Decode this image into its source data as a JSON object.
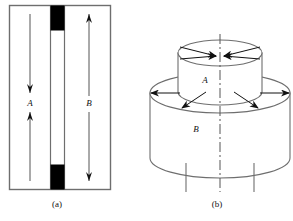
{
  "figure": {
    "type": "technical-line-diagram",
    "background": "#ffffff",
    "stroke_color": "#3f3f3f",
    "fill_black": "#000000",
    "panels": [
      {
        "id": "a",
        "caption": "(a)",
        "description": "rectangular cross-section view with inner vertical channel capped top and bottom by solid black blocks",
        "labels": [
          {
            "text": "A",
            "role": "inner-flow-label"
          },
          {
            "text": "B",
            "role": "outer-flow-label"
          }
        ],
        "arrows": [
          {
            "name": "A-down-arrow",
            "direction": "down"
          },
          {
            "name": "A-up-arrow",
            "direction": "up"
          },
          {
            "name": "B-up-arrow",
            "direction": "up"
          },
          {
            "name": "B-down-arrow",
            "direction": "down"
          }
        ],
        "blocks": [
          {
            "name": "top-plug",
            "color": "#000000"
          },
          {
            "name": "bottom-plug",
            "color": "#000000"
          }
        ]
      },
      {
        "id": "b",
        "caption": "(b)",
        "description": "isometric view of two stacked cylinders, small cylinder A on top of large cylinder B, with radial arrows and a dash-dot centre axis and two support legs",
        "labels": [
          {
            "text": "A",
            "role": "upper-cylinder-label"
          },
          {
            "text": "B",
            "role": "lower-cylinder-label"
          }
        ],
        "arrows": [
          {
            "name": "top-inward-arrow-left",
            "direction": "right"
          },
          {
            "name": "top-inward-arrow-right",
            "direction": "left"
          },
          {
            "name": "mid-outward-arrow-left",
            "direction": "left"
          },
          {
            "name": "mid-outward-arrow-right",
            "direction": "right"
          },
          {
            "name": "lower-diagonal-arrow-left",
            "direction": "down-left"
          },
          {
            "name": "lower-diagonal-arrow-right",
            "direction": "down-right"
          }
        ],
        "axis": {
          "name": "centre-axis",
          "style": "dash-dot"
        },
        "legs": [
          {
            "name": "support-leg-left"
          },
          {
            "name": "support-leg-right"
          }
        ]
      }
    ]
  }
}
